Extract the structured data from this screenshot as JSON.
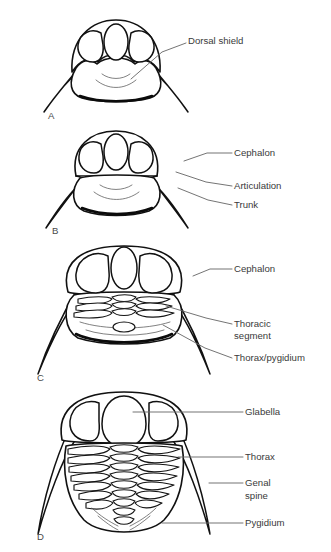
{
  "figure": {
    "kind": "line-diagram",
    "background_color": "#ffffff",
    "line_color": "#111111",
    "label_color": "#3a3a3a",
    "leader_color": "#6d6d6d",
    "width": 331,
    "height": 552
  },
  "panels": [
    {
      "letter": "A",
      "letter_x": 48,
      "letter_y": 116,
      "stage": "protaspid",
      "thoracic_segment_count": 0,
      "labels": [
        {
          "id": "dorsal-shield",
          "text": "Dorsal shield",
          "text_x": 188,
          "text_y": 41,
          "leader": "M 186 43 L 162 52 L 131 79"
        }
      ]
    },
    {
      "letter": "B",
      "letter_x": 52,
      "letter_y": 231,
      "stage": "early meraspid",
      "thoracic_segment_count": 0,
      "labels": [
        {
          "id": "cephalon",
          "text": "Cephalon",
          "text_x": 234,
          "text_y": 153,
          "leader": "M 232 153 L 207 153 L 184 161"
        },
        {
          "id": "articulation",
          "text": "Articulation",
          "text_x": 234,
          "text_y": 186,
          "leader": "M 232 186 L 206 182 L 176 172"
        },
        {
          "id": "trunk",
          "text": "Trunk",
          "text_x": 234,
          "text_y": 205,
          "leader": "M 232 205 L 208 200 L 178 186"
        }
      ]
    },
    {
      "letter": "C",
      "letter_x": 37,
      "letter_y": 378,
      "stage": "late meraspid",
      "thoracic_segment_count": 3,
      "labels": [
        {
          "id": "cephalon",
          "text": "Cephalon",
          "text_x": 234,
          "text_y": 269,
          "leader": "M 232 269 L 210 269 L 193 276"
        },
        {
          "id": "thoracic-segment",
          "text": "Thoracic",
          "text_2": "segment",
          "text_x": 234,
          "text_y": 324,
          "text_y2": 336,
          "leader": "M 232 324 L 206 318 L 166 306"
        },
        {
          "id": "thorax-pygidium",
          "text": "Thorax/pygidium",
          "text_x": 234,
          "text_y": 358,
          "leader": "M 232 358 L 205 348 L 163 325"
        }
      ]
    },
    {
      "letter": "D",
      "letter_x": 37,
      "letter_y": 537,
      "stage": "holaspid",
      "thoracic_segment_count": 8,
      "labels": [
        {
          "id": "glabella",
          "text": "Glabella",
          "text_x": 245,
          "text_y": 412,
          "leader": "M 243 412 L 133 412"
        },
        {
          "id": "thorax",
          "text": "Thorax",
          "text_x": 245,
          "text_y": 457,
          "leader": "M 243 457 L 178 457"
        },
        {
          "id": "genal-spine",
          "text": "Genal",
          "text_2": "spine",
          "text_x": 245,
          "text_y": 483,
          "text_y2": 496,
          "leader": "M 243 483 L 209 483"
        },
        {
          "id": "pygidium",
          "text": "Pygidium",
          "text_x": 245,
          "text_y": 523,
          "leader": "M 243 523 L 162 523"
        }
      ]
    }
  ]
}
